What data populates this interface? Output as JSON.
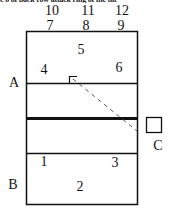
{
  "caption": "e o of back row attack ring of the hit",
  "diagram": {
    "type": "volleyball-court-zones",
    "positions": {
      "p10": "10",
      "p11": "11",
      "p12": "12",
      "p7": "7",
      "p8": "8",
      "p9": "9",
      "p5": "5",
      "p4": "4",
      "p6": "6",
      "p1": "1",
      "p3": "3",
      "p2": "2"
    },
    "side_labels": {
      "a": "A",
      "b": "B",
      "c": "C"
    },
    "colors": {
      "line": "#111111",
      "background": "#ffffff"
    }
  }
}
